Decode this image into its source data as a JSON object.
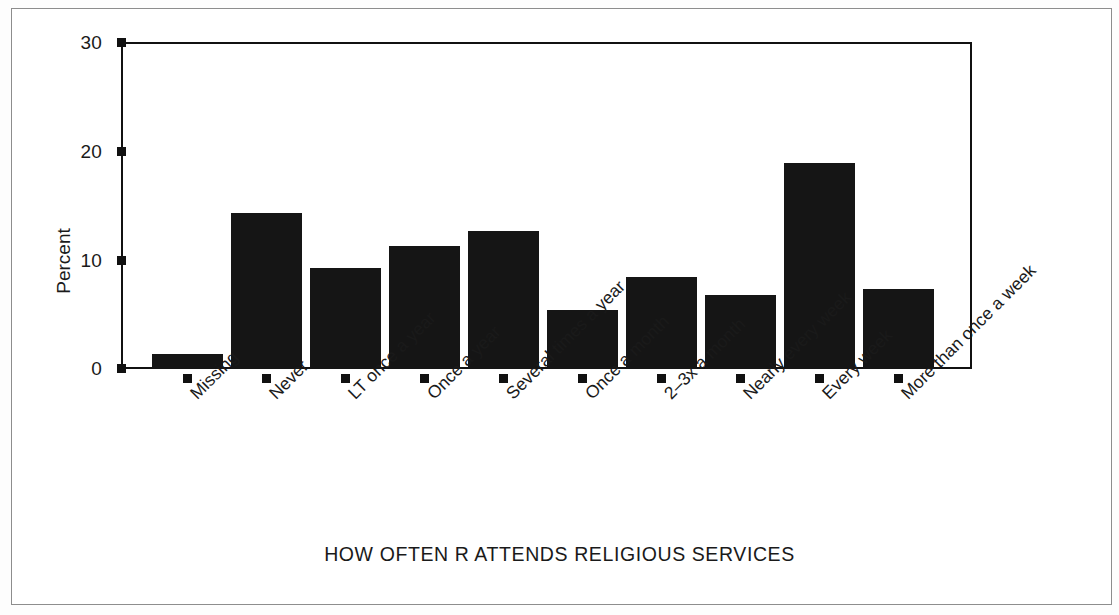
{
  "chart_data": {
    "type": "bar",
    "title": "",
    "xlabel": "HOW OFTEN R ATTENDS RELIGIOUS SERVICES",
    "ylabel": "Percent",
    "categories": [
      "Missing",
      "Never",
      "LT once a year",
      "Once a year",
      "Several times a year",
      "Once a month",
      "2–3x a month",
      "Nearly every week",
      "Every week",
      "More than once a week"
    ],
    "values": [
      1.4,
      14.3,
      9.3,
      11.3,
      12.7,
      5.4,
      8.4,
      6.8,
      18.9,
      7.3
    ],
    "ylim": [
      0,
      30
    ],
    "yticks": [
      0,
      10,
      20,
      30
    ],
    "ytick_labels": [
      "0",
      "10",
      "20",
      "30"
    ],
    "grid": false,
    "legend": "none",
    "bar_color": "#151515"
  },
  "figure": {
    "border_color": "#8d8d8d",
    "axis_color": "#111111"
  }
}
